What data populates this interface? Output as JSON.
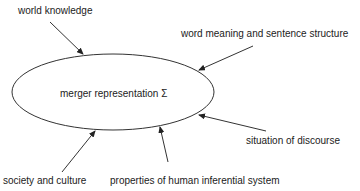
{
  "diagram": {
    "center_label": "merger representation Σ",
    "inputs": [
      {
        "label": "world knowledge"
      },
      {
        "label": "word meaning and sentence structure"
      },
      {
        "label": "situation of discourse"
      },
      {
        "label": "society and culture"
      },
      {
        "label": "properties of human inferential system"
      }
    ]
  }
}
